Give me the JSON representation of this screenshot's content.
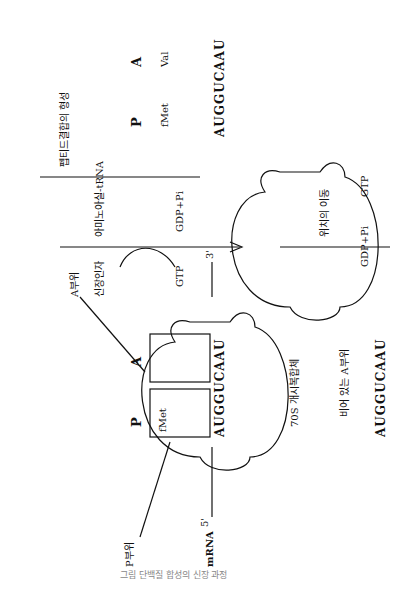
{
  "panels": {
    "initiation_complex": {
      "caption": "70S 개시복합체",
      "p_site_label": "P부위",
      "a_site_label": "A부위",
      "p": "P",
      "a": "A",
      "trna_p": "fMet",
      "mrna_label": "mRNA",
      "five_prime": "5'",
      "three_prime": "3'",
      "codons": "AUGGUCAAU"
    },
    "step1": {
      "factor": "신장인자",
      "substrate": "아미노아실-tRNA",
      "gtp": "GTP",
      "products": "GDP+Pi"
    },
    "complex2": {
      "p": "P",
      "a": "A",
      "trna_p": "fMet",
      "trna_a": "Val",
      "codons": "AUGGUCAAU"
    },
    "step2": {
      "label": "펩티드결합의 형성"
    },
    "complex3": {
      "p": "P",
      "a": "A",
      "trna_a_top": "fMet",
      "trna_a": "Val",
      "codons": "AUGGUCAAU"
    },
    "step3": {
      "label": "위치의 이동",
      "gtp": "GTP",
      "products": "GDP+Pi"
    },
    "complex4": {
      "p": "P",
      "a": "A",
      "trna_p_top": "fMet",
      "trna_p": "Val",
      "empty_a_label": "비어 있는 A부위",
      "codons": "AUGGUCAAU"
    }
  },
  "figure_caption": "그림 단백질 합성의 신장 과정"
}
